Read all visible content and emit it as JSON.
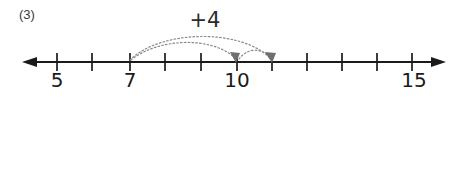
{
  "worksheet": {
    "problem_number": "(3)",
    "background_color": "#ffffff",
    "line_color": "#1a1a1a",
    "arc_color": "#8a8a8a",
    "box_border_color": "#8d8d8d"
  },
  "numberline": {
    "axis_label_left_arrow": "left-arrow",
    "axis_label_right_arrow": "right-arrow",
    "min_visible_value": 4,
    "max_visible_value": 15,
    "tick_spacing_px": 35.5,
    "ticks": [
      {
        "value": 5,
        "x": 57,
        "label": "5"
      },
      {
        "value": 6,
        "x": 92,
        "label": ""
      },
      {
        "value": 7,
        "x": 130,
        "label": "7"
      },
      {
        "value": 8,
        "x": 165,
        "label": ""
      },
      {
        "value": 9,
        "x": 201,
        "label": ""
      },
      {
        "value": 10,
        "x": 237,
        "label": "10"
      },
      {
        "value": 11,
        "x": 272,
        "label": ""
      },
      {
        "value": 12,
        "x": 307,
        "label": ""
      },
      {
        "value": 13,
        "x": 342,
        "label": ""
      },
      {
        "value": 14,
        "x": 377,
        "label": ""
      },
      {
        "value": 15,
        "x": 412,
        "label": "15"
      }
    ],
    "labels": [
      {
        "text": "5",
        "x": 57,
        "y": 69
      },
      {
        "text": "7",
        "x": 130,
        "y": 69
      },
      {
        "text": "10",
        "x": 237,
        "y": 69
      },
      {
        "text": "15",
        "x": 414,
        "y": 69
      }
    ],
    "jump": {
      "label": "+4",
      "label_x": 205,
      "label_y": 10,
      "from_value": 7,
      "to_value": 11,
      "amount": 4,
      "arcs": [
        {
          "name": "arc-7-to-11",
          "from_x": 130,
          "to_x": 272,
          "peak_y": 38
        },
        {
          "name": "arc-7-to-10",
          "from_x": 131,
          "to_x": 236,
          "peak_y": 43
        },
        {
          "name": "arc-10-to-11",
          "from_x": 238,
          "to_x": 271,
          "peak_y": 50
        }
      ]
    }
  },
  "equation": {
    "text": "7 + 4 =",
    "left_operand": "7",
    "operator": "+",
    "right_operand": "4",
    "equals": "=",
    "answer_value": "",
    "answer_placeholder": ""
  }
}
